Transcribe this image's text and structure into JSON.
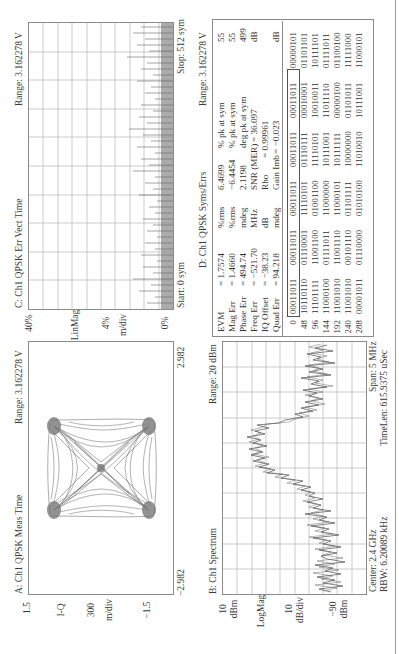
{
  "panels": {
    "A": {
      "title": "A: Ch1 QPSK Meas Time",
      "range": "Range: 3.162278 V",
      "y_top": "1.5",
      "y_unit": "I-Q",
      "y_scale": "300",
      "y_scale_unit": "m/div",
      "y_bottom": "−1.5",
      "x_left": "−2.982",
      "x_right": "2.982"
    },
    "B": {
      "title": "B: Ch1 Spectrum",
      "range": "Range: 20 dBm",
      "y_top": "10",
      "y_top_unit": "dBm",
      "y_mode": "LogMag",
      "y_scale": "10",
      "y_scale_unit": "dB/div",
      "y_bottom": "−90",
      "y_bottom_unit": "dBm",
      "center": "Center: 2.4 GHz",
      "rbw": "RBW: 6.20089 kHz",
      "span": "Span: 5 MHz",
      "timelen": "TimeLen: 615.9375 uSec"
    },
    "C": {
      "title": "C: Ch1 QPSK Err Vect Time",
      "range": "Range: 3.162278 V",
      "y_top": "40%",
      "y_mode": "LinMag",
      "y_scale": "4%",
      "y_scale_unit": "m/div",
      "y_bottom": "0%",
      "start": "Start: 0 sym",
      "stop": "Stop: 512 sym"
    },
    "D": {
      "title": "D: Ch1 QPSK Syms/Errs",
      "range": "Range: 3.162278 V",
      "metrics": [
        {
          "name": "EVM",
          "value": "= 1.7574",
          "unit": "%rms",
          "pk_value": "6.4699",
          "pk_label": "% pk at sym",
          "pk_sym": "55"
        },
        {
          "name": "Mag Err",
          "value": "= 1.4660",
          "unit": "%rms",
          "pk_value": "−6.4454",
          "pk_label": "% pk at sym",
          "pk_sym": "55"
        },
        {
          "name": "Phase Err",
          "value": "= 494.74",
          "unit": "mdeg",
          "pk_value": "2.1198",
          "pk_label": "deg pk at sym",
          "pk_sym": "499"
        },
        {
          "name": "Freq Err",
          "value": "= −521.70",
          "unit": "MHz",
          "pk_value": "SNR (MER)",
          "pk_label": "= 36.097",
          "pk_sym": "dB"
        },
        {
          "name": "IQ Offset",
          "value": "= −38.23",
          "unit": "dB",
          "pk_value": "Rho",
          "pk_label": "= 0.99961",
          "pk_sym": ""
        },
        {
          "name": "Quad Err",
          "value": "= 94.218",
          "unit": "mdeg",
          "pk_value": "Gain Imb",
          "pk_label": "= −0.023",
          "pk_sym": "dB"
        }
      ],
      "symbols": [
        {
          "index": "0",
          "bits": [
            "00011011",
            "00011011",
            "00011011",
            "00011011",
            "00011011",
            "00000101"
          ]
        },
        {
          "index": "48",
          "bits": [
            "10110110",
            "01110001",
            "11110101",
            "01110111",
            "00010001",
            "01101101"
          ]
        },
        {
          "index": "96",
          "bits": [
            "11101111",
            "11001100",
            "01001100",
            "11110101",
            "10010011",
            "10111101"
          ]
        },
        {
          "index": "144",
          "bits": [
            "11000100",
            "01111011",
            "11000000",
            "10111001",
            "11011110",
            "01111011"
          ]
        },
        {
          "index": "192",
          "bits": [
            "11001010",
            "11001110",
            "11000101",
            "10111111",
            "00000100",
            "01100100"
          ]
        },
        {
          "index": "240",
          "bits": [
            "11001010",
            "00101110",
            "01101111",
            "10000000",
            "01101011",
            "11111000"
          ]
        },
        {
          "index": "288",
          "bits": [
            "00001011",
            "01110000",
            "01010100",
            "11010010",
            "10111001",
            "11000101"
          ]
        }
      ]
    }
  },
  "colors": {
    "trace": "#5a5a5a",
    "grid": "#9a9a9a",
    "frame": "#8a8a8a",
    "text": "#333333"
  }
}
